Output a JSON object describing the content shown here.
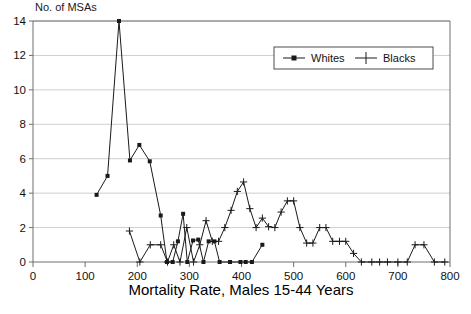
{
  "chart_data": {
    "type": "line",
    "title": "",
    "ylabel": "No. of MSAs",
    "xlabel": "Mortality Rate, Males 15-44 Years",
    "xlim": [
      0,
      800
    ],
    "ylim": [
      0,
      14
    ],
    "xticks": [
      0,
      100,
      200,
      300,
      400,
      500,
      600,
      700,
      800
    ],
    "yticks": [
      0,
      2,
      4,
      6,
      8,
      10,
      12,
      14
    ],
    "grid": "horizontal",
    "legend_position": "top-right",
    "legend": [
      "Whites",
      "Blacks"
    ],
    "series": [
      {
        "name": "Whites",
        "marker": "square",
        "color": "#1a1a1a",
        "points": [
          [
            122,
            3.9
          ],
          [
            143,
            5.0
          ],
          [
            165,
            14.0
          ],
          [
            186,
            5.9
          ],
          [
            204,
            6.8
          ],
          [
            224,
            5.85
          ],
          [
            245,
            2.7
          ],
          [
            257,
            0.0
          ],
          [
            268,
            0.0
          ],
          [
            278,
            1.2
          ],
          [
            288,
            2.8
          ],
          [
            296,
            0.0
          ],
          [
            307,
            1.25
          ],
          [
            317,
            1.3
          ],
          [
            327,
            0.0
          ],
          [
            337,
            1.2
          ],
          [
            348,
            1.2
          ],
          [
            358,
            0.0
          ],
          [
            378,
            0.0
          ],
          [
            398,
            0.0
          ],
          [
            408,
            0.0
          ],
          [
            420,
            0.0
          ],
          [
            440,
            1.0
          ]
        ]
      },
      {
        "name": "Blacks",
        "marker": "plus",
        "color": "#1a1a1a",
        "points": [
          [
            185,
            1.8
          ],
          [
            205,
            0.0
          ],
          [
            225,
            1.0
          ],
          [
            245,
            1.0
          ],
          [
            258,
            0.0
          ],
          [
            270,
            1.0
          ],
          [
            282,
            0.0
          ],
          [
            295,
            2.0
          ],
          [
            308,
            0.0
          ],
          [
            320,
            1.0
          ],
          [
            332,
            2.4
          ],
          [
            344,
            1.2
          ],
          [
            356,
            1.2
          ],
          [
            368,
            2.0
          ],
          [
            380,
            3.0
          ],
          [
            392,
            4.1
          ],
          [
            404,
            4.65
          ],
          [
            416,
            3.1
          ],
          [
            428,
            2.0
          ],
          [
            440,
            2.55
          ],
          [
            452,
            2.05
          ],
          [
            464,
            2.0
          ],
          [
            476,
            2.9
          ],
          [
            488,
            3.55
          ],
          [
            500,
            3.55
          ],
          [
            512,
            2.0
          ],
          [
            525,
            1.1
          ],
          [
            537,
            1.1
          ],
          [
            550,
            2.0
          ],
          [
            562,
            2.0
          ],
          [
            575,
            1.2
          ],
          [
            588,
            1.2
          ],
          [
            600,
            1.2
          ],
          [
            615,
            0.5
          ],
          [
            630,
            0.0
          ],
          [
            650,
            0.0
          ],
          [
            665,
            0.0
          ],
          [
            680,
            0.0
          ],
          [
            700,
            0.0
          ],
          [
            718,
            0.0
          ],
          [
            733,
            1.0
          ],
          [
            750,
            1.0
          ],
          [
            770,
            0.0
          ],
          [
            790,
            0.0
          ]
        ]
      }
    ]
  },
  "labels": {
    "y_axis_caption": "No. of MSAs",
    "x_axis_caption": "Mortality Rate, Males 15-44 Years",
    "legend_whites": "Whites",
    "legend_blacks": "Blacks"
  },
  "colors": {
    "axis": "#6e6e6e",
    "grid": "#cfcfcf",
    "series": "#1a1a1a",
    "text": "#000000",
    "background": "#ffffff"
  }
}
